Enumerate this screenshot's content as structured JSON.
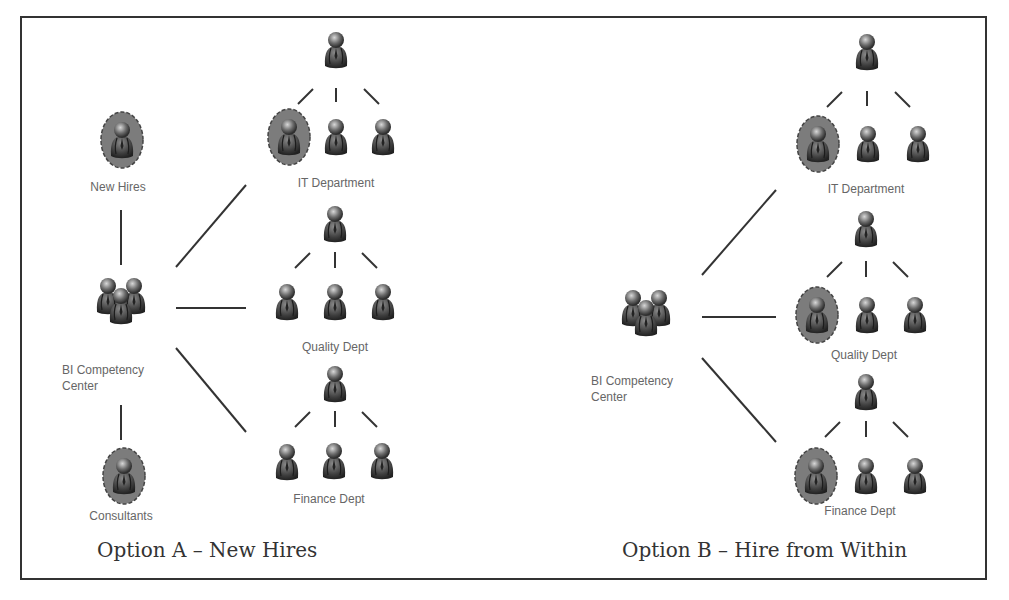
{
  "colors": {
    "frame": "#333333",
    "line": "#333333",
    "person_dark": "#3a3a3a",
    "person_light": "#9a9a9a",
    "highlight_fill": "#7a7a7a",
    "label": "#666666",
    "caption": "#333333"
  },
  "option_a": {
    "caption": "Option A – New Hires",
    "bi_center_label": "BI Competency Center",
    "bi_center_label_line1": "BI Competency",
    "bi_center_label_line2": "Center",
    "new_hires_label": "New Hires",
    "consultants_label": "Consultants",
    "departments": [
      {
        "name": "IT Department",
        "highlighted_member": 0
      },
      {
        "name": "Quality Dept",
        "highlighted_member": -1
      },
      {
        "name": "Finance Dept",
        "highlighted_member": -1
      }
    ]
  },
  "option_b": {
    "caption": "Option B – Hire from Within",
    "bi_center_label_line1": "BI Competency",
    "bi_center_label_line2": "Center",
    "departments": [
      {
        "name": "IT Department",
        "highlighted_member": 0
      },
      {
        "name": "Quality Dept",
        "highlighted_member": 0
      },
      {
        "name": "Finance Dept",
        "highlighted_member": 0
      }
    ]
  }
}
